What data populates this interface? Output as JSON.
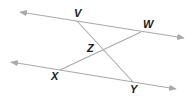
{
  "diagram": {
    "type": "geometry",
    "colors": {
      "line": "#a9a9a9",
      "label": "#1a1a1a",
      "background": "#ffffff"
    },
    "points": {
      "V": {
        "label": "V",
        "x": 77,
        "y": 21,
        "label_x": 74,
        "label_y": 17
      },
      "W": {
        "label": "W",
        "x": 141,
        "y": 32,
        "label_x": 143,
        "label_y": 28
      },
      "Z": {
        "label": "Z",
        "x": 104,
        "y": 50,
        "label_x": 87,
        "label_y": 52
      },
      "X": {
        "label": "X",
        "x": 60,
        "y": 70,
        "label_x": 51,
        "label_y": 80
      },
      "Y": {
        "label": "Y",
        "x": 133,
        "y": 82,
        "label_x": 130,
        "label_y": 93
      }
    },
    "lines": [
      {
        "name": "upper-parallel-line",
        "from": [
          20,
          12
        ],
        "to": [
          184,
          38
        ],
        "arrows": "both"
      },
      {
        "name": "lower-parallel-line",
        "from": [
          11,
          62
        ],
        "to": [
          176,
          89
        ],
        "arrows": "both"
      },
      {
        "name": "segment-VY",
        "from": "V",
        "to": "Y"
      },
      {
        "name": "segment-WX",
        "from": "W",
        "to": "X"
      }
    ]
  }
}
